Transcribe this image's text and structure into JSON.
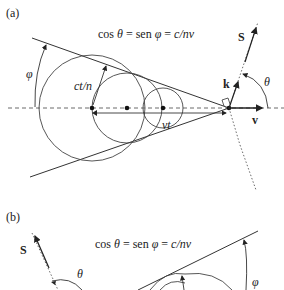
{
  "panel_a": {
    "label": "(a)",
    "formula": {
      "cos": "cos ",
      "theta": "θ",
      "eq1": " = sen ",
      "phi": "φ",
      "eq2": " = ",
      "rhs": "c/nv"
    },
    "labels": {
      "phi": "φ",
      "ct_n": "ct/n",
      "vt": "vt",
      "k": "k",
      "S": "S",
      "theta": "θ",
      "v": "v"
    }
  },
  "panel_b": {
    "label": "(b)",
    "formula": {
      "cos": "cos ",
      "theta": "θ",
      "eq1": " = sen ",
      "phi": "φ",
      "eq2": " = ",
      "rhs": "c/nv"
    },
    "labels": {
      "S": "S",
      "theta": "θ",
      "phi": "φ"
    }
  },
  "colors": {
    "line": "#333333",
    "text": "#222222",
    "background": "#ffffff"
  }
}
